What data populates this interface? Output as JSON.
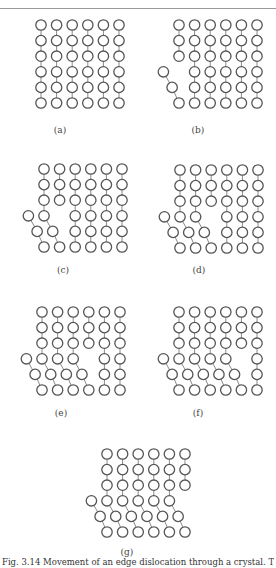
{
  "figure": {
    "lattice": {
      "columns": 6,
      "rows": 6,
      "spacing_px": 15.6,
      "atom_radius_px": 5.2,
      "atom_stroke": "#555555",
      "bond_color": "#8a8a8a"
    },
    "panels": [
      {
        "id": "a",
        "label": "(a)",
        "slipped_columns": 0,
        "origin": [
          41,
          25
        ],
        "label_pos": [
          60,
          131
        ]
      },
      {
        "id": "b",
        "label": "(b)",
        "slipped_columns": 1,
        "origin": [
          179,
          25
        ],
        "label_pos": [
          198,
          131
        ]
      },
      {
        "id": "c",
        "label": "(c)",
        "slipped_columns": 2,
        "origin": [
          44,
          169
        ],
        "label_pos": [
          63,
          271
        ]
      },
      {
        "id": "d",
        "label": "(d)",
        "slipped_columns": 3,
        "origin": [
          180,
          170
        ],
        "label_pos": [
          199,
          271
        ]
      },
      {
        "id": "e",
        "label": "(e)",
        "slipped_columns": 4,
        "origin": [
          42,
          312
        ],
        "label_pos": [
          61,
          414
        ]
      },
      {
        "id": "f",
        "label": "(f)",
        "slipped_columns": 5,
        "origin": [
          179,
          312
        ],
        "label_pos": [
          198,
          414
        ]
      },
      {
        "id": "g",
        "label": "(g)",
        "slipped_columns": 6,
        "origin": [
          107,
          454
        ],
        "label_pos": [
          127,
          553
        ]
      }
    ]
  },
  "caption": {
    "text": "Fig. 3.14  Movement of an edge dislocation through a crystal. The dislocation..."
  }
}
